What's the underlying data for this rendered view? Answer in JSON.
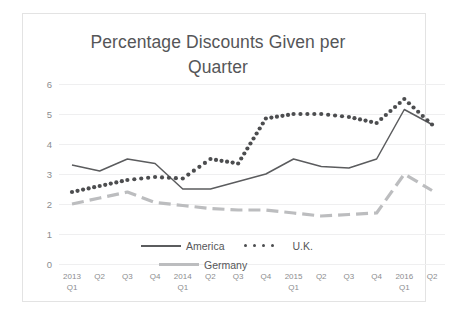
{
  "chart_data": {
    "type": "line",
    "title": "Percentage Discounts Given per\nQuarter",
    "xlabel": "",
    "ylabel": "",
    "ylim": [
      0,
      6
    ],
    "yticks": [
      "0",
      "1",
      "2",
      "3",
      "4",
      "5",
      "6"
    ],
    "grid": true,
    "legend_position": "inside-bottom-center",
    "categories": [
      "2013\nQ1",
      "Q2",
      "Q3",
      "Q4",
      "2014\nQ1",
      "Q2",
      "Q3",
      "Q4",
      "2015\nQ1",
      "Q2",
      "Q3",
      "Q4",
      "2016\nQ1",
      "Q2"
    ],
    "series": [
      {
        "name": "America",
        "style": "solid",
        "color": "#5b5c5e",
        "values": [
          3.3,
          3.1,
          3.5,
          3.35,
          2.5,
          2.5,
          2.75,
          3.0,
          3.5,
          3.25,
          3.2,
          3.5,
          5.15,
          4.65
        ]
      },
      {
        "name": "U.K.",
        "style": "dotted",
        "color": "#4c4d4f",
        "values": [
          2.4,
          2.6,
          2.8,
          2.9,
          2.85,
          3.5,
          3.35,
          4.85,
          5.0,
          5.0,
          4.9,
          4.7,
          5.5,
          4.65
        ]
      },
      {
        "name": "Germany",
        "style": "dashed",
        "color": "#bcbdbf",
        "values": [
          2.0,
          2.2,
          2.4,
          2.05,
          1.95,
          1.85,
          1.8,
          1.8,
          1.7,
          1.6,
          1.65,
          1.7,
          3.0,
          2.45
        ]
      }
    ]
  },
  "legend": {
    "america_label": "America",
    "uk_label": "U.K.",
    "germany_label": "Germany"
  },
  "colors": {
    "america": "#5b5c5e",
    "uk": "#4c4d4f",
    "germany": "#bcbdbf",
    "gridline": "#efeff0",
    "tick_text": "#8c8d8f",
    "title_text": "#555658",
    "card_border": "#e3e3e3",
    "background": "#ffffff"
  }
}
